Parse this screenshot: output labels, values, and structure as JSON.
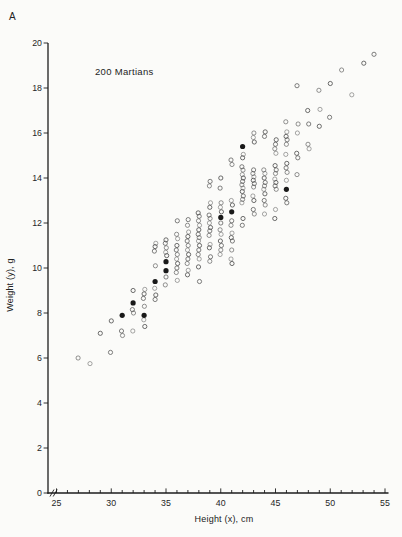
{
  "page": {
    "background": "#fbfbf9",
    "ink": "#1c1c1c",
    "text_color": "#262626"
  },
  "panel_label": "A",
  "chart_data": {
    "type": "scatter",
    "title": "200 Martians",
    "xlabel": "Height (x), cm",
    "ylabel": "Weight (y), g",
    "xlim": [
      25,
      55
    ],
    "ylim": [
      0,
      20
    ],
    "x_major_ticks": [
      25,
      30,
      35,
      40,
      45,
      50,
      55
    ],
    "x_minor_step": 1,
    "y_major_ticks": [
      0,
      2,
      4,
      6,
      8,
      10,
      12,
      14,
      16,
      18,
      20
    ],
    "axis_break_on_x": true,
    "grid": "off",
    "legend": "none",
    "marker": {
      "open_color": "#4d4d4d",
      "filled_color": "#191919"
    },
    "series": [
      {
        "name": "martians-open",
        "marker": "open-circle"
      },
      {
        "name": "martians-sample",
        "marker": "filled-circle"
      }
    ],
    "columns": [
      {
        "h": 27,
        "w": [
          6.0
        ]
      },
      {
        "h": 28,
        "w": [
          5.75
        ]
      },
      {
        "h": 29,
        "w": [
          7.1
        ]
      },
      {
        "h": 30,
        "w": [
          6.25,
          7.65
        ]
      },
      {
        "h": 31,
        "w": [
          7.0,
          7.2
        ]
      },
      {
        "h": 32,
        "w": [
          7.2,
          8.0,
          8.15,
          9.0
        ]
      },
      {
        "h": 33,
        "w": [
          7.4,
          7.7,
          8.3,
          8.65,
          8.85,
          9.05
        ]
      },
      {
        "h": 34,
        "w": [
          8.6,
          8.8,
          9.1,
          10.1,
          10.75,
          10.95,
          11.1
        ]
      },
      {
        "h": 35,
        "w": [
          9.25,
          9.6,
          10.55,
          10.7,
          10.9,
          11.1,
          11.25
        ]
      },
      {
        "h": 36,
        "w": [
          9.45,
          9.8,
          10.0,
          10.2,
          10.4,
          10.6,
          10.8,
          11.0,
          11.3,
          11.5,
          12.1
        ]
      },
      {
        "h": 37,
        "w": [
          9.7,
          9.9,
          10.2,
          10.4,
          10.6,
          10.8,
          11.0,
          11.2,
          11.4,
          11.6,
          11.9,
          12.15
        ]
      },
      {
        "h": 38,
        "w": [
          9.4,
          10.05,
          10.4,
          10.6,
          10.8,
          11.0,
          11.2,
          11.35,
          11.5,
          11.7,
          11.9,
          12.1,
          12.3,
          12.45
        ]
      },
      {
        "h": 39,
        "w": [
          10.3,
          10.5,
          10.9,
          11.05,
          11.45,
          11.65,
          11.8,
          12.0,
          12.2,
          12.35,
          12.7,
          12.9,
          13.65,
          13.85
        ]
      },
      {
        "h": 40,
        "w": [
          10.6,
          10.8,
          11.0,
          11.2,
          11.5,
          11.7,
          12.0,
          12.5,
          12.7,
          12.9,
          13.55,
          14.0
        ]
      },
      {
        "h": 41,
        "w": [
          10.2,
          10.4,
          10.8,
          11.2,
          11.35,
          11.55,
          11.9,
          12.1,
          12.8,
          13.0,
          14.6,
          14.8
        ]
      },
      {
        "h": 42,
        "w": [
          11.9,
          12.2,
          12.9,
          13.05,
          13.2,
          13.4,
          13.55,
          13.7,
          13.85,
          14.0,
          14.15,
          14.35,
          14.5,
          14.9,
          15.05
        ]
      },
      {
        "h": 43,
        "w": [
          12.4,
          12.6,
          13.0,
          13.2,
          13.6,
          13.75,
          13.9,
          14.05,
          14.2,
          14.36,
          15.6,
          15.8,
          16.0
        ]
      },
      {
        "h": 44,
        "w": [
          12.4,
          12.8,
          13.0,
          13.3,
          13.5,
          13.65,
          13.8,
          14.0,
          14.2,
          14.36,
          15.85,
          16.05
        ]
      },
      {
        "h": 45,
        "w": [
          12.2,
          12.6,
          13.5,
          13.65,
          13.8,
          13.95,
          14.2,
          14.36,
          14.55,
          15.1,
          15.3,
          15.5,
          15.7
        ]
      },
      {
        "h": 46,
        "w": [
          12.9,
          13.1,
          13.9,
          14.25,
          14.45,
          14.65,
          15.05,
          15.5,
          15.7,
          15.85,
          16.05,
          16.5
        ]
      },
      {
        "h": 47,
        "w": [
          14.15,
          14.9,
          15.1,
          16.0,
          16.4,
          18.1
        ]
      },
      {
        "h": 48,
        "w": [
          15.3,
          15.5,
          16.4,
          17.0
        ]
      },
      {
        "h": 49,
        "w": [
          16.3,
          17.05,
          17.9
        ]
      },
      {
        "h": 50,
        "w": [
          16.7,
          18.2
        ]
      },
      {
        "h": 51,
        "w": [
          18.8
        ]
      },
      {
        "h": 52,
        "w": [
          17.7
        ]
      },
      {
        "h": 53,
        "w": [
          19.1
        ]
      },
      {
        "h": 54,
        "w": [
          19.5
        ]
      }
    ],
    "sample_points": [
      [
        31,
        7.9
      ],
      [
        32,
        8.45
      ],
      [
        33,
        7.9
      ],
      [
        34,
        9.4
      ],
      [
        35,
        9.88
      ],
      [
        35,
        10.28
      ],
      [
        40,
        12.25
      ],
      [
        41,
        12.5
      ],
      [
        42,
        15.4
      ],
      [
        46,
        13.5
      ]
    ],
    "n_total": 200,
    "n_sample": 10
  }
}
